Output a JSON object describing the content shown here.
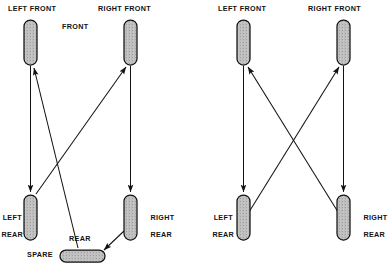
{
  "figure": {
    "type": "diagram",
    "background_color": "#ffffff",
    "ink_color": "#121212",
    "tire_fill_color": "#c8c8c8",
    "panels": [
      {
        "id": "five-tire",
        "name": "five-tire-rotation-with-spare",
        "tire_count": 5,
        "center_label": "FRONT",
        "rear_label": "REAR",
        "spare_label": "SPARE",
        "positions": {
          "left_front": "LEFT FRONT",
          "right_front": "RIGHT FRONT",
          "left_rear_line1": "LEFT",
          "left_rear_line2": "REAR",
          "right_rear_line1": "RIGHT",
          "right_rear_line2": "REAR"
        },
        "moves": [
          {
            "from": "left-front",
            "to": "left-rear"
          },
          {
            "from": "right-front",
            "to": "right-rear"
          },
          {
            "from": "left-rear",
            "to": "right-front"
          },
          {
            "from": "right-rear",
            "to": "spare"
          },
          {
            "from": "spare",
            "to": "left-front"
          }
        ]
      },
      {
        "id": "four-tire",
        "name": "four-tire-cross-rotation",
        "tire_count": 4,
        "positions": {
          "left_front": "LEFT FRONT",
          "right_front": "RIGHT FRONT",
          "left_rear_line1": "LEFT",
          "left_rear_line2": "REAR",
          "right_rear_line1": "RIGHT",
          "right_rear_line2": "REAR"
        },
        "moves": [
          {
            "from": "left-front",
            "to": "left-rear"
          },
          {
            "from": "right-front",
            "to": "right-rear"
          },
          {
            "from": "left-rear",
            "to": "right-front"
          },
          {
            "from": "right-rear",
            "to": "left-front"
          }
        ]
      }
    ]
  }
}
